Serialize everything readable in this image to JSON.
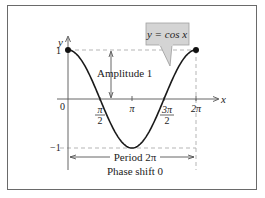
{
  "chart_data": {
    "type": "line",
    "title": "",
    "function_label": "y = cos x",
    "xlabel": "x",
    "ylabel": "y",
    "x_ticks": [
      {
        "value": 0,
        "label": "0"
      },
      {
        "value": 1.5708,
        "label_num": "π",
        "label_den": "2"
      },
      {
        "value": 3.1416,
        "label": "π"
      },
      {
        "value": 4.7124,
        "label_num": "3π",
        "label_den": "2"
      },
      {
        "value": 6.2832,
        "label": "2π"
      }
    ],
    "y_ticks": [
      {
        "value": 1,
        "label": "1"
      },
      {
        "value": -1,
        "label": "−1"
      }
    ],
    "xlim": [
      0,
      6.2832
    ],
    "ylim": [
      -1,
      1
    ],
    "series": [
      {
        "name": "y = cos x",
        "x": [
          0,
          0.7854,
          1.5708,
          2.3562,
          3.1416,
          3.927,
          4.7124,
          5.4978,
          6.2832
        ],
        "y": [
          1,
          0.7071,
          0,
          -0.7071,
          -1,
          -0.7071,
          0,
          0.7071,
          1
        ]
      }
    ],
    "marked_points": [
      {
        "x": 0,
        "y": 1
      },
      {
        "x": 6.2832,
        "y": 1
      }
    ],
    "annotations": {
      "amplitude": "Amplitude 1",
      "period": "Period 2π",
      "phase_shift": "Phase shift 0"
    },
    "grid": false,
    "legend": "callout box top-right"
  },
  "colors": {
    "curve": "#1a1a1a",
    "dashed_guides": "#b5b5b5",
    "label_box": "#d4d4d4",
    "frame": "#6a6a6a",
    "axis": "#555555"
  }
}
